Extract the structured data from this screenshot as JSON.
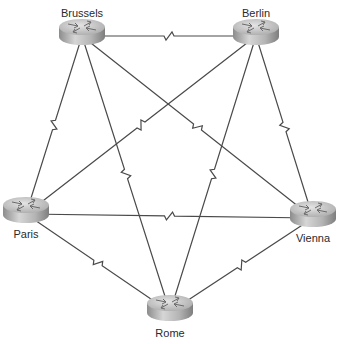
{
  "diagram": {
    "type": "full-mesh network topology",
    "partial_title": "Topology",
    "colors": {
      "link": "#4a4a4a",
      "router_top": "#cfcfcf",
      "router_side": "#9a9a9a",
      "label": "#2a2a2a"
    },
    "routers": [
      {
        "id": "brussels",
        "label": "Brussels",
        "cx": 82,
        "cy": 32,
        "label_y": 7
      },
      {
        "id": "berlin",
        "label": "Berlin",
        "cx": 256,
        "cy": 32,
        "label_y": 7
      },
      {
        "id": "paris",
        "label": "Paris",
        "cx": 26,
        "cy": 210,
        "label_y": 228
      },
      {
        "id": "vienna",
        "label": "Vienna",
        "cx": 313,
        "cy": 214,
        "label_y": 232
      },
      {
        "id": "rome",
        "label": "Rome",
        "cx": 170,
        "cy": 308,
        "label_y": 327
      }
    ],
    "links": [
      {
        "from": "brussels",
        "to": "berlin",
        "type": "serial"
      },
      {
        "from": "brussels",
        "to": "paris",
        "type": "serial"
      },
      {
        "from": "brussels",
        "to": "rome",
        "type": "serial"
      },
      {
        "from": "brussels",
        "to": "vienna",
        "type": "serial"
      },
      {
        "from": "berlin",
        "to": "paris",
        "type": "serial"
      },
      {
        "from": "berlin",
        "to": "rome",
        "type": "serial"
      },
      {
        "from": "berlin",
        "to": "vienna",
        "type": "serial"
      },
      {
        "from": "paris",
        "to": "vienna",
        "type": "serial"
      },
      {
        "from": "paris",
        "to": "rome",
        "type": "serial"
      },
      {
        "from": "vienna",
        "to": "rome",
        "type": "serial"
      }
    ]
  }
}
